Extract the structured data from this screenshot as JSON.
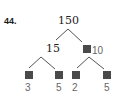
{
  "problem": {
    "number": "44."
  },
  "tree": {
    "root": "150",
    "left": {
      "value": "15",
      "children": [
        "3",
        "5"
      ]
    },
    "right": {
      "value": "10",
      "children": [
        "2",
        "5"
      ]
    }
  },
  "colors": {
    "box": "#4a4a4a",
    "line": "#555555",
    "given_text": "#222222",
    "answer_text": "#666666"
  }
}
